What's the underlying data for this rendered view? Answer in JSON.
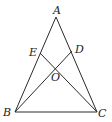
{
  "diagram": {
    "type": "triangle-with-cevians",
    "stroke_color": "#2a2a2a",
    "points": {
      "A": {
        "label": "A",
        "x": 56,
        "y": 17,
        "lx": 53,
        "ly": 14
      },
      "B": {
        "label": "B",
        "x": 15,
        "y": 112,
        "lx": 3,
        "ly": 116
      },
      "C": {
        "label": "C",
        "x": 97,
        "y": 112,
        "lx": 98,
        "ly": 117
      },
      "E": {
        "label": "E",
        "x": 40,
        "y": 53,
        "lx": 29,
        "ly": 56
      },
      "D": {
        "label": "D",
        "x": 72,
        "y": 51,
        "lx": 75,
        "ly": 53
      },
      "O": {
        "label": "O",
        "x": 56,
        "y": 68,
        "lx": 51,
        "ly": 81
      }
    },
    "segments": [
      [
        "A",
        "B"
      ],
      [
        "A",
        "C"
      ],
      [
        "B",
        "C"
      ],
      [
        "B",
        "D"
      ],
      [
        "C",
        "E"
      ]
    ]
  }
}
